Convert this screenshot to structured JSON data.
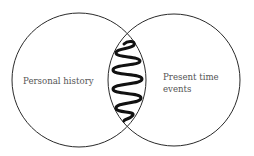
{
  "diagram": {
    "type": "venn",
    "left_circle": {
      "label": "Personal history"
    },
    "right_circle": {
      "label_line1": "Present time",
      "label_line2": "events"
    },
    "intersection": {
      "content": "squiggle-line"
    },
    "colors": {
      "stroke": "#2a2a2a",
      "text": "#555555",
      "background": "#ffffff"
    }
  }
}
